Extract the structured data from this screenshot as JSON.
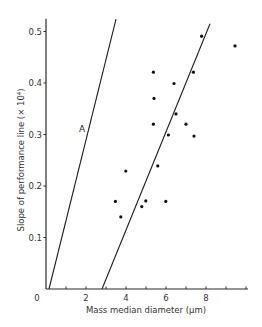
{
  "chart_data": {
    "type": "scatter",
    "title": "",
    "xlabel": "Mass median diameter (µm)",
    "ylabel": "Slope of performance line (× 10⁴)",
    "xlim": [
      0,
      10.1
    ],
    "ylim": [
      0,
      0.525
    ],
    "x_ticks": [
      0,
      1,
      2,
      3,
      4,
      5,
      6,
      7,
      8,
      9,
      10
    ],
    "x_tick_labels": [
      "0",
      "",
      "2",
      "",
      "4",
      "",
      "6",
      "",
      "8",
      "",
      ""
    ],
    "y_ticks": [
      0.1,
      0.2,
      0.3,
      0.4,
      0.5
    ],
    "y_tick_labels": [
      "0.1",
      "0.2",
      "0.3",
      "0.4",
      "0.5"
    ],
    "grid": false,
    "legend": null,
    "series": [
      {
        "name": "measurements",
        "kind": "scatter",
        "points": [
          [
            7.78,
            0.491
          ],
          [
            9.45,
            0.472
          ],
          [
            5.37,
            0.421
          ],
          [
            7.37,
            0.421
          ],
          [
            6.4,
            0.399
          ],
          [
            5.4,
            0.37
          ],
          [
            6.5,
            0.34
          ],
          [
            5.37,
            0.32
          ],
          [
            7.0,
            0.32
          ],
          [
            6.12,
            0.299
          ],
          [
            7.4,
            0.297
          ],
          [
            5.59,
            0.239
          ],
          [
            3.99,
            0.229
          ],
          [
            3.47,
            0.17
          ],
          [
            4.99,
            0.171
          ],
          [
            5.99,
            0.17
          ],
          [
            4.79,
            0.16
          ],
          [
            3.74,
            0.14
          ]
        ]
      },
      {
        "name": "A",
        "kind": "line",
        "points": [
          [
            0.15,
            0.0
          ],
          [
            3.5,
            0.524
          ]
        ]
      },
      {
        "name": "fit",
        "kind": "line",
        "points": [
          [
            2.8,
            0.0
          ],
          [
            8.2,
            0.515
          ]
        ]
      }
    ],
    "annotations": [
      {
        "text": "A",
        "x": 1.8,
        "y": 0.305
      }
    ]
  }
}
